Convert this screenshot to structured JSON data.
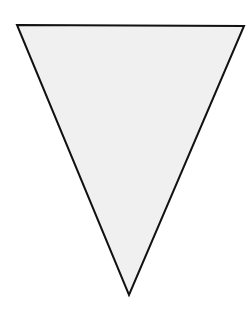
{
  "canvas": {
    "width": 247,
    "height": 318,
    "background": "#ffffff"
  },
  "shape": {
    "type": "inverted-triangle",
    "description": "pennant / bunting flag outline",
    "points": "17,25 244,26 129,295",
    "fill": "#f0f0f0",
    "stroke": "#111111",
    "stroke_width": 2
  }
}
